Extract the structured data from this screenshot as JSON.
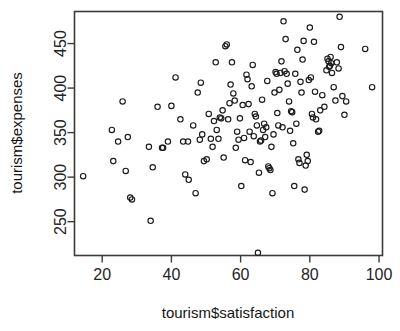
{
  "chart_data": {
    "type": "scatter",
    "title": "",
    "xlabel": "tourism$satisfaction",
    "ylabel": "tourism$expenses",
    "xlim": [
      12,
      101
    ],
    "ylim": [
      212,
      486
    ],
    "grid": false,
    "legend": null,
    "xticks": [
      20,
      40,
      60,
      80,
      100
    ],
    "yticks": [
      250,
      300,
      350,
      400,
      450
    ],
    "xtick_labels": [
      "20",
      "40",
      "60",
      "80",
      "100"
    ],
    "ytick_labels": [
      "250",
      "300",
      "350",
      "400",
      "450"
    ],
    "marker": "open-circle",
    "marker_color": "#1b1b1b",
    "n_points": 150,
    "points": [
      [
        14.5,
        301
      ],
      [
        22.8,
        353
      ],
      [
        23.2,
        318
      ],
      [
        24.6,
        340
      ],
      [
        25.9,
        385
      ],
      [
        26.8,
        307
      ],
      [
        27.4,
        345
      ],
      [
        28.1,
        277
      ],
      [
        28.6,
        275
      ],
      [
        33.5,
        334
      ],
      [
        34.0,
        251
      ],
      [
        34.6,
        311
      ],
      [
        36.0,
        379
      ],
      [
        37.3,
        333
      ],
      [
        37.6,
        333
      ],
      [
        39.0,
        340
      ],
      [
        40.0,
        380
      ],
      [
        41.2,
        412
      ],
      [
        42.6,
        365
      ],
      [
        43.4,
        340
      ],
      [
        44.0,
        303
      ],
      [
        45.0,
        297
      ],
      [
        46.3,
        358
      ],
      [
        47.0,
        282
      ],
      [
        47.6,
        395
      ],
      [
        48.2,
        342
      ],
      [
        48.5,
        406
      ],
      [
        48.9,
        348
      ],
      [
        49.4,
        318
      ],
      [
        50.2,
        320
      ],
      [
        50.8,
        371
      ],
      [
        51.4,
        343
      ],
      [
        51.9,
        334
      ],
      [
        52.3,
        363
      ],
      [
        52.8,
        429
      ],
      [
        53.1,
        353
      ],
      [
        53.6,
        343
      ],
      [
        54.0,
        367
      ],
      [
        54.4,
        366
      ],
      [
        54.8,
        375
      ],
      [
        55.1,
        322
      ],
      [
        55.6,
        447
      ],
      [
        56.0,
        449
      ],
      [
        56.4,
        365
      ],
      [
        56.8,
        383
      ],
      [
        57.1,
        404
      ],
      [
        57.5,
        429
      ],
      [
        57.9,
        394
      ],
      [
        58.3,
        386
      ],
      [
        58.6,
        333
      ],
      [
        59.0,
        351
      ],
      [
        59.4,
        342
      ],
      [
        59.8,
        366
      ],
      [
        60.2,
        290
      ],
      [
        60.6,
        381
      ],
      [
        61.0,
        344
      ],
      [
        61.3,
        319
      ],
      [
        61.7,
        415
      ],
      [
        62.0,
        410
      ],
      [
        62.3,
        382
      ],
      [
        62.6,
        351
      ],
      [
        62.9,
        317
      ],
      [
        63.2,
        402
      ],
      [
        63.5,
        426
      ],
      [
        63.8,
        346
      ],
      [
        64.1,
        371
      ],
      [
        64.4,
        368
      ],
      [
        64.7,
        358
      ],
      [
        65.0,
        215
      ],
      [
        65.3,
        305
      ],
      [
        65.6,
        340
      ],
      [
        65.9,
        341
      ],
      [
        66.2,
        387
      ],
      [
        66.5,
        353
      ],
      [
        66.8,
        360
      ],
      [
        67.1,
        345
      ],
      [
        67.4,
        356
      ],
      [
        67.7,
        408
      ],
      [
        68.0,
        312
      ],
      [
        68.3,
        310
      ],
      [
        68.6,
        308
      ],
      [
        68.9,
        334
      ],
      [
        69.2,
        282
      ],
      [
        69.5,
        348
      ],
      [
        69.8,
        395
      ],
      [
        70.1,
        418
      ],
      [
        70.4,
        416
      ],
      [
        70.6,
        372
      ],
      [
        70.9,
        358
      ],
      [
        71.2,
        398
      ],
      [
        71.5,
        417
      ],
      [
        71.8,
        430
      ],
      [
        72.1,
        356
      ],
      [
        72.4,
        475
      ],
      [
        72.7,
        419
      ],
      [
        73.0,
        455
      ],
      [
        73.3,
        416
      ],
      [
        73.6,
        405
      ],
      [
        74.0,
        385
      ],
      [
        74.3,
        352
      ],
      [
        74.6,
        374
      ],
      [
        74.9,
        373
      ],
      [
        75.2,
        338
      ],
      [
        75.5,
        290
      ],
      [
        75.8,
        416
      ],
      [
        76.1,
        360
      ],
      [
        76.4,
        443
      ],
      [
        76.7,
        320
      ],
      [
        77.0,
        316
      ],
      [
        77.3,
        407
      ],
      [
        77.6,
        395
      ],
      [
        77.9,
        432
      ],
      [
        78.2,
        453
      ],
      [
        78.5,
        286
      ],
      [
        78.8,
        313
      ],
      [
        79.1,
        325
      ],
      [
        79.4,
        318
      ],
      [
        79.7,
        409
      ],
      [
        80.0,
        468
      ],
      [
        80.3,
        412
      ],
      [
        80.6,
        371
      ],
      [
        80.9,
        367
      ],
      [
        81.2,
        452
      ],
      [
        81.5,
        396
      ],
      [
        81.8,
        365
      ],
      [
        82.4,
        351
      ],
      [
        82.7,
        352
      ],
      [
        83.0,
        375
      ],
      [
        83.6,
        392
      ],
      [
        84.2,
        379
      ],
      [
        84.8,
        420
      ],
      [
        85.1,
        433
      ],
      [
        85.4,
        430
      ],
      [
        85.6,
        424
      ],
      [
        85.8,
        425
      ],
      [
        86.0,
        435
      ],
      [
        86.2,
        428
      ],
      [
        86.4,
        417
      ],
      [
        86.9,
        401
      ],
      [
        87.4,
        386
      ],
      [
        87.8,
        429
      ],
      [
        88.3,
        422
      ],
      [
        88.6,
        480
      ],
      [
        89.0,
        446
      ],
      [
        89.4,
        391
      ],
      [
        90.0,
        370
      ],
      [
        90.5,
        385
      ],
      [
        96.0,
        444
      ],
      [
        98.0,
        401
      ],
      [
        44.8,
        340
      ]
    ]
  },
  "axes": {
    "x_title": "tourism$satisfaction",
    "y_title": "tourism$expenses"
  }
}
